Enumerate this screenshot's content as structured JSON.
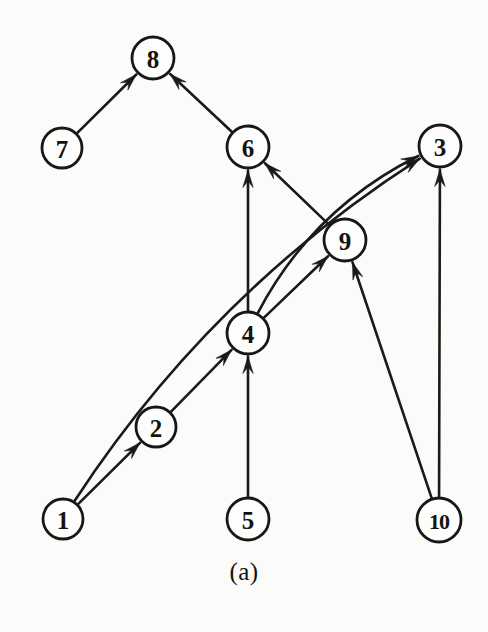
{
  "figure": {
    "caption": "(a)",
    "background_color": "#fbfbfa",
    "ink_color": "#1a1a18",
    "node_fill": "#fdfdfc",
    "type": "directed-graph",
    "width": 488,
    "height": 632
  },
  "graph": {
    "nodes": [
      {
        "id": "8",
        "label": "8",
        "x": 153,
        "y": 58,
        "r": 21
      },
      {
        "id": "7",
        "label": "7",
        "x": 62,
        "y": 148,
        "r": 20
      },
      {
        "id": "6",
        "label": "6",
        "x": 248,
        "y": 147,
        "r": 21
      },
      {
        "id": "3",
        "label": "3",
        "x": 440,
        "y": 146,
        "r": 21
      },
      {
        "id": "9",
        "label": "9",
        "x": 345,
        "y": 240,
        "r": 21
      },
      {
        "id": "4",
        "label": "4",
        "x": 248,
        "y": 333,
        "r": 21
      },
      {
        "id": "2",
        "label": "2",
        "x": 156,
        "y": 427,
        "r": 20
      },
      {
        "id": "1",
        "label": "1",
        "x": 63,
        "y": 519,
        "r": 20
      },
      {
        "id": "5",
        "label": "5",
        "x": 248,
        "y": 519,
        "r": 21
      },
      {
        "id": "10",
        "label": "10",
        "x": 439,
        "y": 520,
        "r": 22
      }
    ],
    "edges": [
      {
        "from": "7",
        "to": "8",
        "shape": "straight"
      },
      {
        "from": "6",
        "to": "8",
        "shape": "straight"
      },
      {
        "from": "4",
        "to": "6",
        "shape": "straight"
      },
      {
        "from": "9",
        "to": "6",
        "shape": "straight"
      },
      {
        "from": "4",
        "to": "9",
        "shape": "straight"
      },
      {
        "from": "10",
        "to": "9",
        "shape": "straight"
      },
      {
        "from": "4",
        "to": "3",
        "shape": "curved"
      },
      {
        "from": "1",
        "to": "3",
        "shape": "curved"
      },
      {
        "from": "10",
        "to": "3",
        "shape": "straight"
      },
      {
        "from": "2",
        "to": "4",
        "shape": "straight"
      },
      {
        "from": "5",
        "to": "4",
        "shape": "straight"
      },
      {
        "from": "1",
        "to": "2",
        "shape": "straight"
      }
    ]
  }
}
